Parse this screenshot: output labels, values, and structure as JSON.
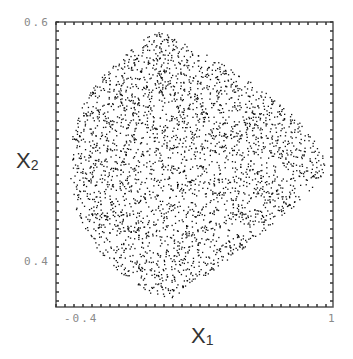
{
  "chart_data": {
    "type": "scatter",
    "title": "",
    "xlabel": "X1",
    "ylabel": "X2",
    "xlabel_main": "X",
    "xlabel_sub": "1",
    "ylabel_main": "X",
    "ylabel_sub": "2",
    "xlim": [
      -0.5,
      1.0
    ],
    "ylim": [
      0.35,
      0.6
    ],
    "x_tick_labels": [
      {
        "value": -0.4,
        "label": "-0.4"
      },
      {
        "value": 1.0,
        "label": "1"
      }
    ],
    "y_tick_labels": [
      {
        "value": 0.6,
        "label": "0.6"
      },
      {
        "value": 0.4,
        "label": "0.4"
      }
    ],
    "grid": false,
    "legend": null,
    "point_cloud": {
      "description": "Dense cloud of ~3000 small black points filling a rounded, shield-like region; left edge near x=-0.42, right tip near x=0.95 at x2≈0.50, top near x2≈0.59, bottom near x2≈0.36; a sparse horizontal gap runs through the middle near x2≈0.51",
      "n_points": 3000,
      "center": [
        0.2,
        0.475
      ],
      "extent_x": [
        -0.42,
        0.95
      ],
      "extent_y": [
        0.36,
        0.595
      ],
      "point_color": "#111111"
    }
  },
  "frame": {
    "left_px": 56,
    "top_px": 22,
    "right_px": 333,
    "bottom_px": 307,
    "tick_spacing_px": 9,
    "frame_color": "#555555"
  }
}
